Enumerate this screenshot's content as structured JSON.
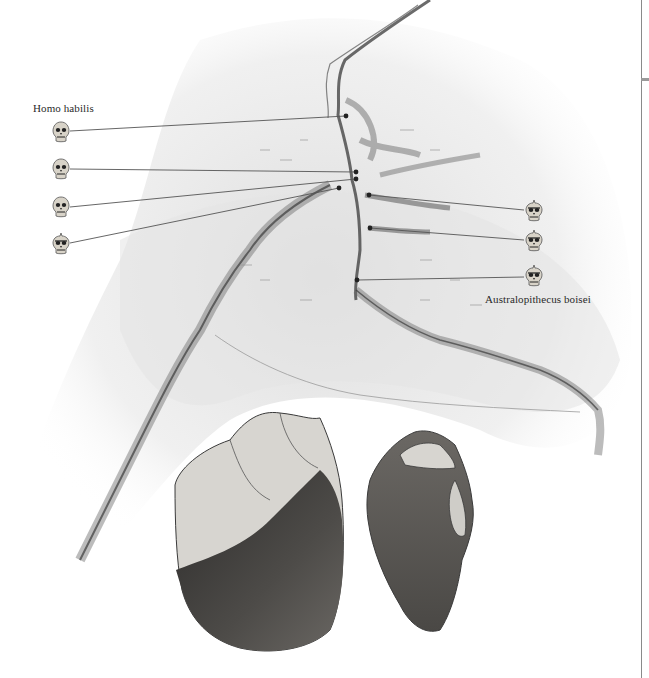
{
  "figure": {
    "type": "illustrated map of Olduvai Gorge with stone tools",
    "labels": {
      "homo_habilis": "Homo habilis",
      "australopithecus_boisei": "Australopithecus boisei"
    },
    "homo_habilis_sites": [
      {
        "skull_type": "homo",
        "icon_x": 52,
        "icon_y": 121,
        "site_x": 346,
        "site_y": 116
      },
      {
        "skull_type": "homo",
        "icon_x": 52,
        "icon_y": 158,
        "site_x": 356,
        "site_y": 172
      },
      {
        "skull_type": "homo",
        "icon_x": 52,
        "icon_y": 196,
        "site_x": 356,
        "site_y": 179
      },
      {
        "skull_type": "crested",
        "icon_x": 52,
        "icon_y": 233,
        "site_x": 339,
        "site_y": 188
      }
    ],
    "australopithecus_boisei_sites": [
      {
        "skull_type": "crested",
        "icon_x": 525,
        "icon_y": 200,
        "site_x": 369,
        "site_y": 195
      },
      {
        "skull_type": "crested",
        "icon_x": 525,
        "icon_y": 230,
        "site_x": 370,
        "site_y": 228
      },
      {
        "skull_type": "crested",
        "icon_x": 525,
        "icon_y": 265,
        "site_x": 357,
        "site_y": 280
      }
    ],
    "artifacts": [
      {
        "name": "chopper-tool",
        "description": "pebble chopper with flaked top and dark cortex base"
      },
      {
        "name": "flake-tool",
        "description": "flaked stone tool with scalloped top edge"
      }
    ],
    "colors": {
      "ink": "#3a3a3a",
      "shade": "#cfcfcf",
      "pointer": "#555555",
      "skull_fill": "#d8d3c8",
      "dark_stone": "#4a4845"
    }
  }
}
